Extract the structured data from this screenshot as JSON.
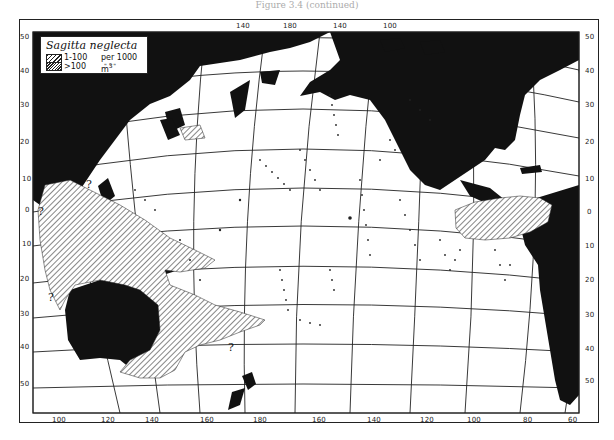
{
  "caption": "Figure 3.4 (continued)",
  "legend": {
    "title": "Sagitta neglecta",
    "entries": [
      {
        "range": "1-100",
        "unit": "per 1000 m3",
        "pattern": "light-hatch"
      },
      {
        "range": ">100",
        "unit": "\"   \"   \"",
        "pattern": "dense-hatch"
      }
    ],
    "unit_label": "per 1000 m",
    "unit_sup": "3",
    "ditto": "\"     \"     \""
  },
  "axes": {
    "top_lon_ticks": [
      "140",
      "180",
      "140",
      "100"
    ],
    "bottom_lon_ticks": [
      "100",
      "120",
      "140",
      "160",
      "180",
      "160",
      "140",
      "120",
      "100",
      "80",
      "60"
    ],
    "left_lat_ticks": [
      "50",
      "40",
      "30",
      "20",
      "10",
      "0",
      "10",
      "20",
      "30",
      "40",
      "50"
    ],
    "right_lat_ticks": [
      "50",
      "40",
      "30",
      "20",
      "10",
      "0",
      "10",
      "20",
      "30",
      "40",
      "50"
    ]
  },
  "annotations": {
    "question_marks": [
      "?",
      "?",
      "?",
      "?"
    ]
  },
  "colors": {
    "land": "#111111",
    "ocean": "#ffffff",
    "grid": "#222222"
  }
}
